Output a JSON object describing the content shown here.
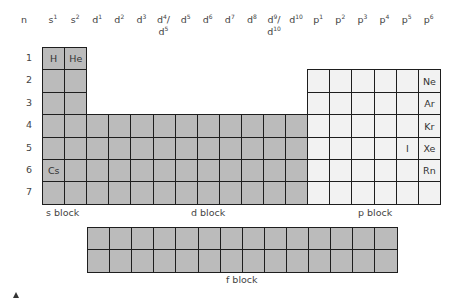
{
  "header": {
    "n": "n",
    "columns": [
      {
        "base": "s",
        "sup": "1"
      },
      {
        "base": "s",
        "sup": "2"
      },
      {
        "base": "d",
        "sup": "1"
      },
      {
        "base": "d",
        "sup": "2"
      },
      {
        "base": "d",
        "sup": "3"
      },
      {
        "base": "d",
        "sup": "4",
        "alt": "d5"
      },
      {
        "base": "d",
        "sup": "5"
      },
      {
        "base": "d",
        "sup": "6"
      },
      {
        "base": "d",
        "sup": "7"
      },
      {
        "base": "d",
        "sup": "8"
      },
      {
        "base": "d",
        "sup": "9",
        "alt": "d10"
      },
      {
        "base": "d",
        "sup": "10"
      },
      {
        "base": "p",
        "sup": "1"
      },
      {
        "base": "p",
        "sup": "2"
      },
      {
        "base": "p",
        "sup": "3"
      },
      {
        "base": "p",
        "sup": "4"
      },
      {
        "base": "p",
        "sup": "5"
      },
      {
        "base": "p",
        "sup": "6"
      }
    ]
  },
  "rows": [
    "1",
    "2",
    "3",
    "4",
    "5",
    "6",
    "7"
  ],
  "elements": [
    {
      "symbol": "H",
      "row": 1,
      "col": 1
    },
    {
      "symbol": "He",
      "row": 1,
      "col": 2
    },
    {
      "symbol": "Cs",
      "row": 6,
      "col": 1
    },
    {
      "symbol": "Ne",
      "row": 2,
      "col": 18
    },
    {
      "symbol": "Ar",
      "row": 3,
      "col": 18
    },
    {
      "symbol": "Kr",
      "row": 4,
      "col": 18
    },
    {
      "symbol": "Xe",
      "row": 5,
      "col": 18
    },
    {
      "symbol": "I",
      "row": 5,
      "col": 17
    },
    {
      "symbol": "Rn",
      "row": 6,
      "col": 18
    }
  ],
  "block_labels": {
    "s": "s block",
    "d": "d block",
    "p": "p block",
    "f": "f block"
  },
  "colors": {
    "metal_fill": "#bbbbbb",
    "p_block_fill": "#f2f2f2",
    "border": "#1e1e1e"
  },
  "f_block": {
    "columns": 14,
    "rows": 2
  }
}
